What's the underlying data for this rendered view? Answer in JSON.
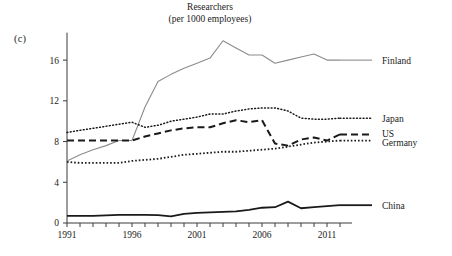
{
  "figure": {
    "panel_label": "(c)",
    "background": "#ffffff",
    "caption": ""
  },
  "chart_data": {
    "type": "line",
    "title": "Researchers",
    "subtitle": "(per 1000 employees)",
    "xlabel": "",
    "ylabel": "",
    "xlim": [
      1991,
      2012
    ],
    "ylim": [
      0,
      18.5
    ],
    "xticks": [
      1991,
      1992,
      1993,
      1994,
      1995,
      1996,
      1997,
      1998,
      1999,
      2000,
      2001,
      2002,
      2003,
      2004,
      2005,
      2006,
      2007,
      2008,
      2009,
      2010,
      2011,
      2012
    ],
    "xtick_labels": [
      "1991",
      "",
      "",
      "",
      "",
      "1996",
      "",
      "",
      "",
      "",
      "2001",
      "",
      "",
      "",
      "",
      "2006",
      "",
      "",
      "",
      "",
      "2011",
      ""
    ],
    "yticks": [
      0,
      4,
      8,
      12,
      16
    ],
    "ytick_labels": [
      "0",
      "4",
      "8",
      "12",
      "16"
    ],
    "grid": false,
    "legend_position": "right-of-axes",
    "x": [
      1991,
      1992,
      1993,
      1994,
      1995,
      1996,
      1997,
      1998,
      1999,
      2000,
      2001,
      2002,
      2003,
      2004,
      2005,
      2006,
      2007,
      2008,
      2009,
      2010,
      2011,
      2012
    ],
    "series": [
      {
        "name": "Finland",
        "color": "#8c8c8c",
        "style": "solid",
        "values": [
          6.1,
          6.7,
          7.2,
          7.6,
          8.1,
          8.1,
          11.4,
          13.9,
          14.6,
          15.2,
          15.7,
          16.2,
          17.9,
          17.2,
          16.5,
          16.5,
          15.7,
          16.0,
          16.3,
          16.6,
          16.0,
          16.0
        ]
      },
      {
        "name": "Japan",
        "color": "#1a1a1a",
        "style": "dotted",
        "values": [
          8.9,
          9.1,
          9.3,
          9.5,
          9.7,
          9.9,
          9.4,
          9.6,
          10.0,
          10.2,
          10.4,
          10.7,
          10.7,
          11.0,
          11.2,
          11.3,
          11.3,
          11.0,
          10.3,
          10.2,
          10.2,
          10.3
        ]
      },
      {
        "name": "US",
        "color": "#1a1a1a",
        "style": "dashed",
        "values": [
          8.1,
          8.1,
          8.1,
          8.1,
          8.1,
          8.1,
          8.5,
          8.8,
          9.1,
          9.3,
          9.4,
          9.4,
          9.8,
          10.1,
          9.9,
          10.1,
          7.8,
          7.6,
          8.2,
          8.4,
          8.1,
          8.7
        ]
      },
      {
        "name": "Germany",
        "color": "#1a1a1a",
        "style": "densely-dotted",
        "values": [
          6.0,
          5.9,
          5.9,
          5.9,
          5.9,
          6.1,
          6.2,
          6.3,
          6.5,
          6.7,
          6.8,
          6.9,
          7.0,
          7.0,
          7.1,
          7.2,
          7.3,
          7.5,
          7.7,
          7.9,
          8.0,
          8.1
        ]
      },
      {
        "name": "China",
        "color": "#1a1a1a",
        "style": "solid-thick",
        "values": [
          0.7,
          0.7,
          0.7,
          0.75,
          0.8,
          0.8,
          0.8,
          0.78,
          0.65,
          0.9,
          1.0,
          1.05,
          1.1,
          1.15,
          1.3,
          1.5,
          1.55,
          2.1,
          1.45,
          1.55,
          1.65,
          1.75
        ]
      }
    ],
    "legend_entries": [
      {
        "label": "Finland",
        "y_value": 16.0
      },
      {
        "label": "Japan",
        "y_value": 10.3
      },
      {
        "label": "US",
        "y_value": 8.7
      },
      {
        "label": "Germany",
        "y_value": 7.6
      },
      {
        "label": "China",
        "y_value": 1.75
      }
    ]
  }
}
